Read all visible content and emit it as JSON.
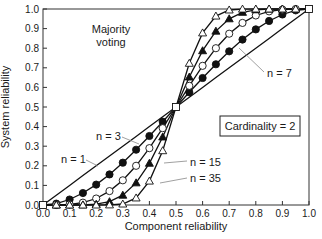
{
  "chart_data": {
    "type": "line",
    "title": "",
    "xlabel": "Component reliability",
    "ylabel": "System reliability",
    "xlim": [
      0.0,
      1.0
    ],
    "ylim": [
      0.0,
      1.0
    ],
    "xticks": [
      "0.0",
      "0.1",
      "0.2",
      "0.3",
      "0.4",
      "0.5",
      "0.6",
      "0.7",
      "0.8",
      "0.9",
      "1.0"
    ],
    "yticks": [
      "0.0",
      "0.1",
      "0.2",
      "0.3",
      "0.4",
      "0.5",
      "0.6",
      "0.7",
      "0.8",
      "0.9",
      "1.0"
    ],
    "grid": false,
    "annotations": {
      "top_left": [
        "Majority",
        "voting"
      ],
      "box": "Cardinality = 2"
    },
    "x": [
      0.0,
      0.05,
      0.1,
      0.15,
      0.2,
      0.25,
      0.3,
      0.35,
      0.4,
      0.45,
      0.5,
      0.55,
      0.6,
      0.65,
      0.7,
      0.75,
      0.8,
      0.85,
      0.9,
      0.95,
      1.0
    ],
    "series": [
      {
        "name": "n = 1",
        "marker": "none",
        "values": [
          0.0,
          0.05,
          0.1,
          0.15,
          0.2,
          0.25,
          0.3,
          0.35,
          0.4,
          0.45,
          0.5,
          0.55,
          0.6,
          0.65,
          0.7,
          0.75,
          0.8,
          0.85,
          0.9,
          0.95,
          1.0
        ]
      },
      {
        "name": "n = 3",
        "marker": "filled-circle",
        "values": [
          0.0,
          0.007,
          0.028,
          0.061,
          0.104,
          0.156,
          0.216,
          0.282,
          0.352,
          0.425,
          0.5,
          0.575,
          0.648,
          0.718,
          0.784,
          0.844,
          0.896,
          0.939,
          0.972,
          0.993,
          1.0
        ]
      },
      {
        "name": "n = 7",
        "marker": "open-circle",
        "values": [
          0.0,
          0.0002,
          0.003,
          0.012,
          0.033,
          0.071,
          0.126,
          0.2,
          0.29,
          0.392,
          0.5,
          0.608,
          0.71,
          0.8,
          0.874,
          0.929,
          0.967,
          0.988,
          0.997,
          0.9998,
          1.0
        ]
      },
      {
        "name": "n = 15",
        "marker": "filled-triangle",
        "values": [
          0.0,
          0.0,
          3e-05,
          0.0006,
          0.004,
          0.017,
          0.05,
          0.113,
          0.213,
          0.347,
          0.5,
          0.653,
          0.787,
          0.887,
          0.95,
          0.983,
          0.996,
          0.9994,
          1.0,
          1.0,
          1.0
        ]
      },
      {
        "name": "n = 35",
        "marker": "open-triangle",
        "values": [
          0.0,
          0.0,
          0.0,
          0.0,
          0.0,
          0.0005,
          0.005,
          0.036,
          0.122,
          0.277,
          0.5,
          0.723,
          0.878,
          0.964,
          0.995,
          0.9995,
          1.0,
          1.0,
          1.0,
          1.0,
          1.0
        ]
      }
    ],
    "legend": "inline labels with leader lines"
  }
}
